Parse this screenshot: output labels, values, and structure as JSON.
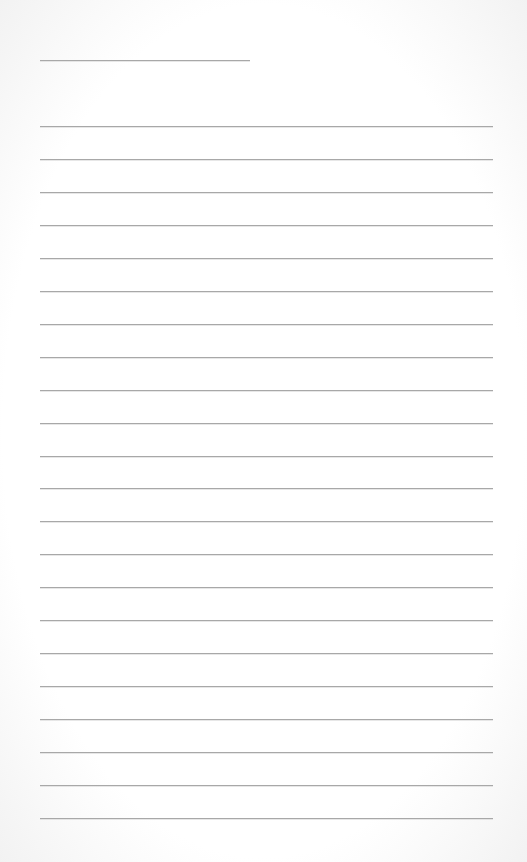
{
  "page": {
    "type": "lined-paper",
    "background": "#ffffff",
    "line_color": "#a8a8a8",
    "title_line": {
      "x": 40,
      "y": 60,
      "width": 210
    },
    "ruled_lines": {
      "count": 22,
      "x": 40,
      "width": 453,
      "first_y": 126,
      "spacing": 32.95
    }
  }
}
